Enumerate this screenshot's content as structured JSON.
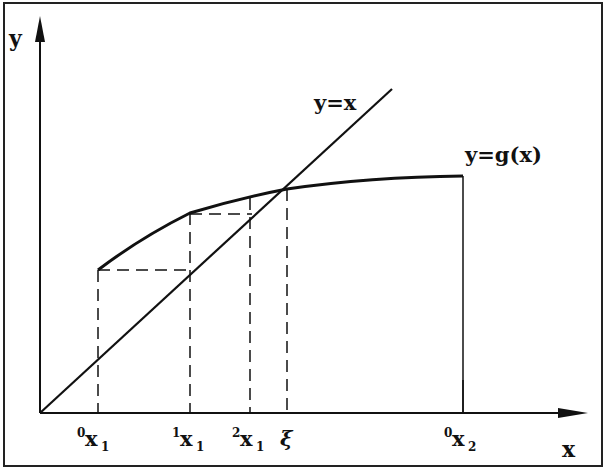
{
  "diagram": {
    "axes": {
      "x_label": "x",
      "y_label": "y"
    },
    "curves": {
      "identity_label": "y=x",
      "g_label": "y=g(x)"
    },
    "ticks": [
      {
        "pre": "0",
        "main": "x",
        "sub": "1"
      },
      {
        "pre": "1",
        "main": "x",
        "sub": "1"
      },
      {
        "pre": "2",
        "main": "x",
        "sub": "1"
      },
      {
        "pre": "",
        "main": "ξ",
        "sub": ""
      },
      {
        "pre": "0",
        "main": "x",
        "sub": "2"
      }
    ],
    "colors": {
      "line": "#111111",
      "background": "#ffffff"
    }
  }
}
